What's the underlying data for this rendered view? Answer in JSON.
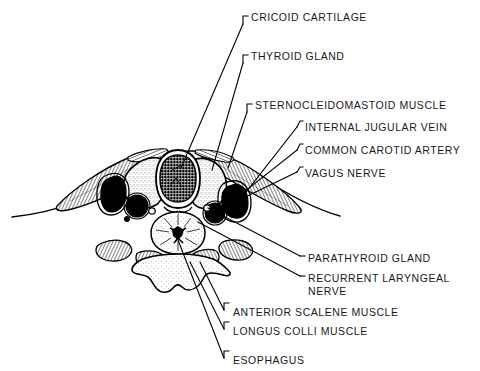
{
  "figure": {
    "kind": "anatomical-cross-section",
    "region": "neck cross-section at level of cricoid cartilage",
    "ink_color": "#000000",
    "background_color": "#ffffff",
    "stipple_dark_color": "#111111",
    "stipple_light_color": "#6b6b6b"
  },
  "labels": [
    {
      "id": "cricoid-cartilage",
      "text": "CRICOID CARTILAGE",
      "x": 251,
      "y": 11
    },
    {
      "id": "thyroid-gland",
      "text": "THYROID GLAND",
      "x": 251,
      "y": 50
    },
    {
      "id": "sternocleidomastoid",
      "text": "STERNOCLEIDOMASTOID MUSCLE",
      "x": 255,
      "y": 99
    },
    {
      "id": "internal-jugular-vein",
      "text": "INTERNAL JUGULAR VEIN",
      "x": 305,
      "y": 121
    },
    {
      "id": "common-carotid-artery",
      "text": "COMMON CAROTID ARTERY",
      "x": 305,
      "y": 144
    },
    {
      "id": "vagus-nerve",
      "text": "VAGUS NERVE",
      "x": 305,
      "y": 167
    },
    {
      "id": "parathyroid-gland",
      "text": "PARATHYROID GLAND",
      "x": 308,
      "y": 252
    },
    {
      "id": "recurrent-laryngeal-nerve",
      "text": "RECURRENT LARYNGEAL",
      "x": 308,
      "y": 272
    },
    {
      "id": "recurrent-laryngeal-nerve2",
      "text": "NERVE",
      "x": 308,
      "y": 285
    },
    {
      "id": "anterior-scalene-muscle",
      "text": "ANTERIOR SCALENE MUSCLE",
      "x": 233,
      "y": 306
    },
    {
      "id": "longus-colli-muscle",
      "text": "LONGUS COLLI MUSCLE",
      "x": 233,
      "y": 325
    },
    {
      "id": "esophagus",
      "text": "ESOPHAGUS",
      "x": 233,
      "y": 354
    }
  ],
  "structures": [
    {
      "id": "skin-outline",
      "name": "skin and subcutaneous outline"
    },
    {
      "id": "cricoid-cartilage-shape",
      "name": "cricoid cartilage"
    },
    {
      "id": "thyroid-lobe-left",
      "name": "thyroid gland left lobe"
    },
    {
      "id": "thyroid-lobe-right",
      "name": "thyroid gland right lobe"
    },
    {
      "id": "sternocleidomastoid-left",
      "name": "left sternocleidomastoid muscle"
    },
    {
      "id": "sternocleidomastoid-right",
      "name": "right sternocleidomastoid muscle"
    },
    {
      "id": "jugular-vein-left",
      "name": "left internal jugular vein"
    },
    {
      "id": "carotid-artery-left",
      "name": "left common carotid artery"
    },
    {
      "id": "jugular-vein-right",
      "name": "right internal jugular vein"
    },
    {
      "id": "carotid-artery-right",
      "name": "right common carotid artery"
    },
    {
      "id": "vagus-nerve-right",
      "name": "right vagus nerve"
    },
    {
      "id": "esophagus-shape",
      "name": "esophagus"
    },
    {
      "id": "parathyroid-dots",
      "name": "parathyroid glands"
    },
    {
      "id": "recurrent-nerve-dots",
      "name": "recurrent laryngeal nerves"
    },
    {
      "id": "vertebral-body",
      "name": "cervical vertebral body"
    },
    {
      "id": "longus-colli-muscles",
      "name": "longus colli muscles"
    },
    {
      "id": "scalene-muscles",
      "name": "anterior scalene muscles"
    }
  ]
}
